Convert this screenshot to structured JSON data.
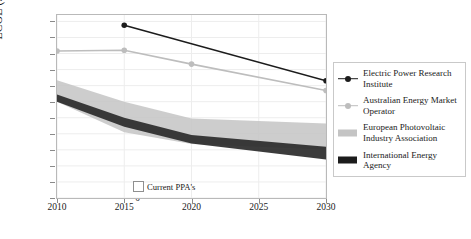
{
  "chart_data": {
    "type": "line",
    "title": "",
    "xlabel": "",
    "ylabel": "LCOE ($/MWh)",
    "xlim": [
      2010,
      2030
    ],
    "ylim": [
      0,
      570
    ],
    "xticks": [
      2010,
      2015,
      2020,
      2025,
      2030
    ],
    "yticks": [
      0,
      50,
      100,
      150,
      200,
      250,
      300,
      350,
      400,
      450,
      500,
      550
    ],
    "grid": true,
    "legend_position": "right-outside",
    "series": [
      {
        "name": "Electric Power Research Institute",
        "kind": "line",
        "color": "#1c1c1c",
        "marker": "circle",
        "x": [
          2015,
          2030
        ],
        "values": [
          538,
          365
        ]
      },
      {
        "name": "Australian Energy Market Operator",
        "kind": "line",
        "color": "#bdbdbd",
        "marker": "circle",
        "x": [
          2010,
          2015,
          2020,
          2030
        ],
        "values": [
          458,
          460,
          417,
          335
        ]
      },
      {
        "name": "European Photovoltaic Industry Association",
        "kind": "band",
        "color": "#c4c4c4",
        "x": [
          2010,
          2015,
          2020,
          2030
        ],
        "upper": [
          367,
          300,
          248,
          232
        ],
        "lower": [
          300,
          205,
          168,
          150
        ]
      },
      {
        "name": "International Energy Agency",
        "kind": "band",
        "color": "#2b2b2b",
        "x": [
          2010,
          2015,
          2020,
          2030
        ],
        "upper": [
          322,
          250,
          196,
          160
        ],
        "lower": [
          300,
          222,
          170,
          120
        ]
      }
    ],
    "annotations": [
      {
        "text": "Current PPA's",
        "swatch": "empty-square",
        "x": 2018,
        "y": 55
      }
    ]
  },
  "axis": {
    "ylabel": "LCOE ($/MWh)",
    "yticks": [
      "550",
      "500",
      "450",
      "400",
      "350",
      "300",
      "250",
      "200",
      "150",
      "100",
      "50",
      "0"
    ],
    "xticks": [
      "2010",
      "2015",
      "2020",
      "2025",
      "2030"
    ]
  },
  "legend": {
    "items": [
      {
        "label": "Electric Power Research Institute",
        "key": "line-marker-dark",
        "color": "#1c1c1c"
      },
      {
        "label": "Australian Energy Market Operator",
        "key": "line-marker-light",
        "color": "#bdbdbd"
      },
      {
        "label": "European Photovoltaic Industry Association",
        "key": "band-light",
        "color": "#c4c4c4"
      },
      {
        "label": "International Energy Agency",
        "key": "band-dark",
        "color": "#1c1c1c"
      }
    ]
  },
  "annotation": {
    "ppa_label": "Current PPA's"
  }
}
